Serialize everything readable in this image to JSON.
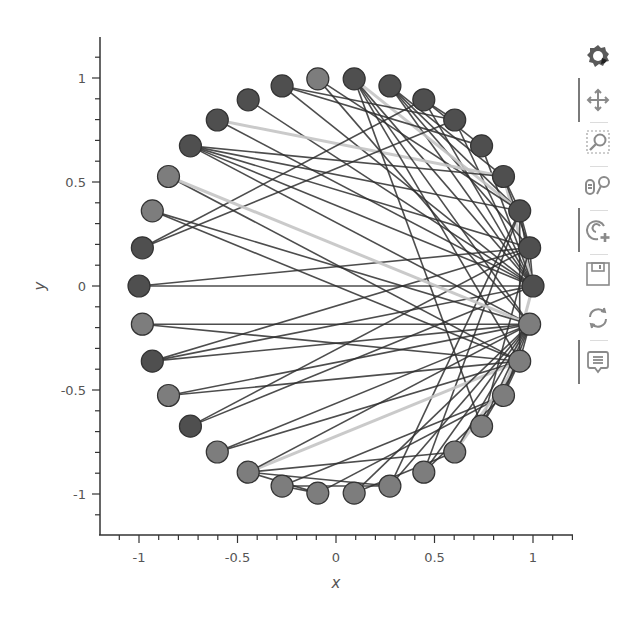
{
  "chart_data": {
    "type": "scatter",
    "subtype": "network-graph-circular-layout",
    "title": "",
    "xlabel": "x",
    "ylabel": "y",
    "xlim": [
      -1.2,
      1.2
    ],
    "ylim": [
      -1.2,
      1.2
    ],
    "x_ticks": [
      -1,
      -0.5,
      0,
      0.5,
      1
    ],
    "x_tick_labels": [
      "-1",
      "-0.5",
      "0",
      "0.5",
      "1"
    ],
    "y_ticks": [
      -1,
      -0.5,
      0,
      0.5,
      1
    ],
    "y_tick_labels": [
      "-1",
      "-0.5",
      "0",
      "0.5",
      "1"
    ],
    "grid": false,
    "legend": null,
    "node_count": 34,
    "node_radius_px": 11,
    "node_groups": [
      0,
      0,
      0,
      0,
      0,
      0,
      0,
      0,
      0,
      1,
      0,
      0,
      0,
      0,
      1,
      1,
      0,
      0,
      1,
      0,
      1,
      0,
      1,
      1,
      1,
      1,
      1,
      1,
      1,
      1,
      1,
      1,
      1,
      1
    ],
    "group_colors": [
      "#4f4f4f",
      "#7d7d7d"
    ],
    "node_outline": "#333333",
    "edges": [
      [
        0,
        1
      ],
      [
        0,
        2
      ],
      [
        0,
        3
      ],
      [
        0,
        4
      ],
      [
        0,
        5
      ],
      [
        0,
        6
      ],
      [
        0,
        7
      ],
      [
        0,
        8
      ],
      [
        0,
        10
      ],
      [
        0,
        11
      ],
      [
        0,
        12
      ],
      [
        0,
        13
      ],
      [
        0,
        17
      ],
      [
        0,
        19
      ],
      [
        0,
        21
      ],
      [
        0,
        31
      ],
      [
        1,
        2
      ],
      [
        1,
        3
      ],
      [
        1,
        7
      ],
      [
        1,
        13
      ],
      [
        1,
        17
      ],
      [
        1,
        19
      ],
      [
        1,
        21
      ],
      [
        1,
        30
      ],
      [
        2,
        3
      ],
      [
        2,
        7
      ],
      [
        2,
        8
      ],
      [
        2,
        9
      ],
      [
        2,
        13
      ],
      [
        2,
        27
      ],
      [
        2,
        28
      ],
      [
        2,
        32
      ],
      [
        3,
        7
      ],
      [
        3,
        12
      ],
      [
        3,
        13
      ],
      [
        4,
        6
      ],
      [
        4,
        10
      ],
      [
        5,
        6
      ],
      [
        5,
        10
      ],
      [
        5,
        16
      ],
      [
        6,
        16
      ],
      [
        8,
        30
      ],
      [
        8,
        32
      ],
      [
        8,
        33
      ],
      [
        9,
        33
      ],
      [
        13,
        33
      ],
      [
        14,
        32
      ],
      [
        14,
        33
      ],
      [
        15,
        32
      ],
      [
        15,
        33
      ],
      [
        18,
        32
      ],
      [
        18,
        33
      ],
      [
        19,
        33
      ],
      [
        20,
        32
      ],
      [
        20,
        33
      ],
      [
        22,
        32
      ],
      [
        22,
        33
      ],
      [
        23,
        25
      ],
      [
        23,
        27
      ],
      [
        23,
        29
      ],
      [
        23,
        32
      ],
      [
        23,
        33
      ],
      [
        24,
        25
      ],
      [
        24,
        27
      ],
      [
        24,
        31
      ],
      [
        25,
        31
      ],
      [
        26,
        29
      ],
      [
        26,
        33
      ],
      [
        27,
        33
      ],
      [
        28,
        31
      ],
      [
        28,
        33
      ],
      [
        29,
        32
      ],
      [
        29,
        33
      ],
      [
        30,
        32
      ],
      [
        30,
        33
      ],
      [
        31,
        32
      ],
      [
        31,
        33
      ],
      [
        32,
        33
      ]
    ],
    "edge_light_indices": [
      2,
      15,
      26,
      33,
      47,
      60,
      71
    ],
    "edge_color": "#2e2e2e",
    "edge_light_color": "#c4c4c4"
  },
  "axes": {
    "x_title": "x",
    "y_title": "y"
  },
  "toolbar": {
    "items": [
      {
        "name": "bokeh-logo",
        "label": "Bokeh",
        "active": false
      },
      {
        "name": "pan-tool",
        "label": "Pan",
        "active": true
      },
      {
        "name": "box-zoom-tool",
        "label": "Box Zoom",
        "active": false
      },
      {
        "name": "wheel-zoom-tool",
        "label": "Wheel Zoom",
        "active": false
      },
      {
        "name": "zoom-in-tool",
        "label": "Zoom In / Tap",
        "active": true
      },
      {
        "name": "save-tool",
        "label": "Save",
        "active": false
      },
      {
        "name": "reset-tool",
        "label": "Reset",
        "active": false
      },
      {
        "name": "hover-tool",
        "label": "Hover",
        "active": true
      }
    ]
  }
}
